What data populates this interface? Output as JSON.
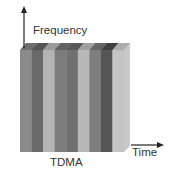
{
  "figure": {
    "y_axis_label": "Frequency",
    "x_axis_label": "Time",
    "caption": "TDMA",
    "axis_color": "#222222",
    "stripes": [
      {
        "front": "#8a8a8a",
        "top": "#6e6e6e"
      },
      {
        "front": "#6a6a6a",
        "top": "#555555"
      },
      {
        "front": "#b4b4b4",
        "top": "#9c9c9c"
      },
      {
        "front": "#7c7c7c",
        "top": "#626262"
      },
      {
        "front": "#707070",
        "top": "#5a5a5a"
      },
      {
        "front": "#b8b8b8",
        "top": "#a0a0a0"
      },
      {
        "front": "#7e7e7e",
        "top": "#666666"
      },
      {
        "front": "#555555",
        "top": "#404040"
      },
      {
        "front": "#c4c4c4",
        "top": "#acacac"
      }
    ],
    "side_color": "#c9c9c9"
  }
}
